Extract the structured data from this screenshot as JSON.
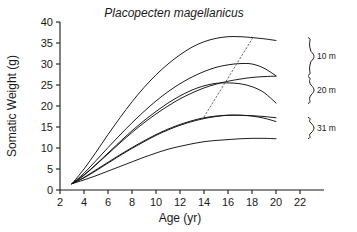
{
  "chart_data": {
    "type": "line",
    "title": "Placopecten magellanicus",
    "xlabel": "Age (yr)",
    "ylabel": "Somatic Weight (g)",
    "xlim": [
      2,
      22
    ],
    "ylim": [
      0,
      40
    ],
    "xticks": [
      2,
      4,
      6,
      8,
      10,
      12,
      14,
      16,
      18,
      20,
      22
    ],
    "yticks": [
      0,
      5,
      10,
      15,
      20,
      25,
      30,
      35,
      40
    ],
    "xtick_labels": [
      "2",
      "4",
      "6",
      "8",
      "10",
      "12",
      "14",
      "16",
      "18",
      "20",
      "22"
    ],
    "ytick_labels": [
      "0",
      "5",
      "10",
      "15",
      "20",
      "25",
      "30",
      "35",
      "40"
    ],
    "grid": false,
    "legend_position": "right-braces",
    "x": [
      3,
      4,
      5,
      6,
      7,
      8,
      9,
      10,
      11,
      12,
      13,
      14,
      15,
      16,
      17,
      18,
      19,
      20
    ],
    "series": [
      {
        "name": "10 m - upper",
        "group": "10 m",
        "values": [
          1.5,
          5.0,
          9.0,
          13.2,
          17.2,
          21.0,
          24.4,
          27.4,
          30.0,
          32.2,
          34.0,
          35.3,
          36.1,
          36.5,
          36.5,
          36.3,
          36.0,
          35.6
        ]
      },
      {
        "name": "10 m - lower",
        "group": "10 m",
        "values": [
          1.5,
          4.0,
          7.0,
          10.1,
          13.1,
          16.0,
          18.7,
          21.2,
          23.4,
          25.3,
          26.9,
          28.2,
          29.2,
          29.8,
          30.1,
          30.0,
          29.0,
          27.2
        ]
      },
      {
        "name": "20 m - upper",
        "group": "20 m",
        "values": [
          1.5,
          3.6,
          6.1,
          8.8,
          11.5,
          14.1,
          16.5,
          18.7,
          20.7,
          22.4,
          23.8,
          24.8,
          25.4,
          25.5,
          25.3,
          24.6,
          23.2,
          20.7
        ]
      },
      {
        "name": "20 m - lower",
        "group": "20 m",
        "values": [
          1.5,
          3.5,
          6.0,
          8.6,
          11.2,
          13.7,
          16.0,
          18.1,
          20.0,
          21.7,
          23.1,
          24.3,
          25.2,
          25.9,
          26.4,
          26.8,
          27.0,
          27.1
        ]
      },
      {
        "name": "31 m - upper",
        "group": "31 m",
        "values": [
          1.5,
          3.0,
          4.8,
          6.6,
          8.4,
          10.1,
          11.7,
          13.2,
          14.5,
          15.6,
          16.5,
          17.2,
          17.6,
          17.8,
          17.8,
          17.7,
          17.5,
          17.2
        ]
      },
      {
        "name": "31 m - middle",
        "group": "31 m",
        "values": [
          1.5,
          2.9,
          4.6,
          6.4,
          8.2,
          9.9,
          11.5,
          13.0,
          14.3,
          15.4,
          16.3,
          17.0,
          17.5,
          17.8,
          17.8,
          17.6,
          17.1,
          16.3
        ]
      },
      {
        "name": "31 m - lower",
        "group": "31 m",
        "values": [
          1.5,
          2.4,
          3.4,
          4.5,
          5.6,
          6.7,
          7.8,
          8.8,
          9.7,
          10.4,
          11.0,
          11.5,
          11.8,
          12.0,
          12.2,
          12.3,
          12.3,
          12.2
        ]
      }
    ],
    "annotations": [
      {
        "name": "isopleth-dotted-line",
        "type": "dotted-line",
        "from": [
          14.0,
          17.4
        ],
        "to": [
          18.1,
          36.4
        ]
      }
    ],
    "braces": [
      {
        "label": "10 m",
        "y_top": 36.3,
        "y_bottom": 27.3
      },
      {
        "label": "20 m",
        "y_top": 27.0,
        "y_bottom": 20.6
      },
      {
        "label": "31 m",
        "y_top": 17.3,
        "y_bottom": 12.2
      }
    ]
  }
}
